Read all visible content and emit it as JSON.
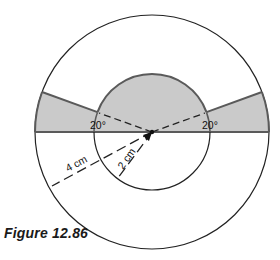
{
  "figure": {
    "caption": "Figure 12.86",
    "colors": {
      "shade": "#cacaca",
      "shade_stroke": "#5a5a5a",
      "line": "#222222",
      "background": "#ffffff"
    },
    "geometry": {
      "center": [
        152,
        132
      ],
      "outer_radius": 117,
      "inner_radius": 58,
      "wedge_angle_deg": 20
    },
    "labels": {
      "left_angle": "20°",
      "right_angle": "20°",
      "outer_radius": "4 cm",
      "inner_radius": "2 cm"
    },
    "shapes": [
      {
        "name": "outer-circle",
        "radius_cm": 4
      },
      {
        "name": "inner-circle",
        "radius_cm": 2
      },
      {
        "name": "shaded-upper-semicircle-inner",
        "description": "upper half of inner circle"
      },
      {
        "name": "shaded-left-wedge",
        "angle_deg": 20
      },
      {
        "name": "shaded-right-wedge",
        "angle_deg": 20
      }
    ]
  }
}
